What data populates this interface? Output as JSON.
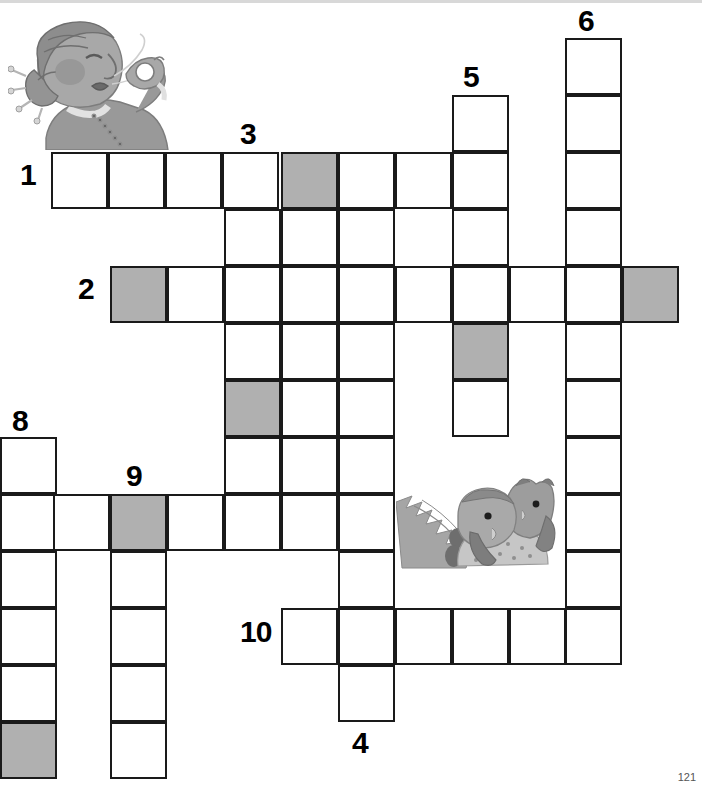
{
  "page": {
    "number": "121",
    "type": "crossword-puzzle-worksheet",
    "background_color": "#ffffff",
    "ink_color": "#1a1a1a",
    "shaded_cell_color": "#b0b0b0"
  },
  "grid": {
    "cell_size": 57,
    "origin_x": 0,
    "origin_y": 38,
    "columns_x": [
      0,
      53,
      110,
      167,
      224,
      281,
      338,
      395,
      452,
      509,
      565,
      622
    ],
    "rows_y": [
      38,
      95,
      152,
      209,
      266,
      323,
      380,
      437,
      494,
      551,
      608,
      665,
      722
    ],
    "cells": [
      {
        "x": 565,
        "y": 38,
        "shaded": false
      },
      {
        "x": 565,
        "y": 95,
        "shaded": false
      },
      {
        "x": 452,
        "y": 95,
        "shaded": false
      },
      {
        "x": 565,
        "y": 152,
        "shaded": false
      },
      {
        "x": 452,
        "y": 152,
        "shaded": false
      },
      {
        "x": 51,
        "y": 152,
        "shaded": false
      },
      {
        "x": 108,
        "y": 152,
        "shaded": false
      },
      {
        "x": 165,
        "y": 152,
        "shaded": false
      },
      {
        "x": 222,
        "y": 152,
        "shaded": false
      },
      {
        "x": 281,
        "y": 152,
        "shaded": true
      },
      {
        "x": 338,
        "y": 152,
        "shaded": false
      },
      {
        "x": 395,
        "y": 152,
        "shaded": false
      },
      {
        "x": 452,
        "y": 209,
        "shaded": false
      },
      {
        "x": 565,
        "y": 209,
        "shaded": false
      },
      {
        "x": 224,
        "y": 209,
        "shaded": false
      },
      {
        "x": 281,
        "y": 209,
        "shaded": false
      },
      {
        "x": 338,
        "y": 209,
        "shaded": false
      },
      {
        "x": 110,
        "y": 266,
        "shaded": true
      },
      {
        "x": 167,
        "y": 266,
        "shaded": false
      },
      {
        "x": 224,
        "y": 266,
        "shaded": false
      },
      {
        "x": 281,
        "y": 266,
        "shaded": false
      },
      {
        "x": 338,
        "y": 266,
        "shaded": false
      },
      {
        "x": 395,
        "y": 266,
        "shaded": false
      },
      {
        "x": 452,
        "y": 266,
        "shaded": false
      },
      {
        "x": 509,
        "y": 266,
        "shaded": false
      },
      {
        "x": 565,
        "y": 266,
        "shaded": false
      },
      {
        "x": 622,
        "y": 266,
        "shaded": true
      },
      {
        "x": 224,
        "y": 323,
        "shaded": false
      },
      {
        "x": 281,
        "y": 323,
        "shaded": false
      },
      {
        "x": 338,
        "y": 323,
        "shaded": false
      },
      {
        "x": 452,
        "y": 323,
        "shaded": true
      },
      {
        "x": 565,
        "y": 323,
        "shaded": false
      },
      {
        "x": 224,
        "y": 380,
        "shaded": true
      },
      {
        "x": 281,
        "y": 380,
        "shaded": false
      },
      {
        "x": 338,
        "y": 380,
        "shaded": false
      },
      {
        "x": 452,
        "y": 380,
        "shaded": false
      },
      {
        "x": 565,
        "y": 380,
        "shaded": false
      },
      {
        "x": 0,
        "y": 437,
        "shaded": false
      },
      {
        "x": 224,
        "y": 437,
        "shaded": false
      },
      {
        "x": 281,
        "y": 437,
        "shaded": false
      },
      {
        "x": 338,
        "y": 437,
        "shaded": false
      },
      {
        "x": 565,
        "y": 437,
        "shaded": false
      },
      {
        "x": 0,
        "y": 494,
        "shaded": false
      },
      {
        "x": 53,
        "y": 494,
        "shaded": false
      },
      {
        "x": 110,
        "y": 494,
        "shaded": true
      },
      {
        "x": 167,
        "y": 494,
        "shaded": false
      },
      {
        "x": 224,
        "y": 494,
        "shaded": false
      },
      {
        "x": 281,
        "y": 494,
        "shaded": false
      },
      {
        "x": 338,
        "y": 494,
        "shaded": false
      },
      {
        "x": 565,
        "y": 494,
        "shaded": false
      },
      {
        "x": 0,
        "y": 551,
        "shaded": false
      },
      {
        "x": 110,
        "y": 551,
        "shaded": false
      },
      {
        "x": 338,
        "y": 551,
        "shaded": false
      },
      {
        "x": 565,
        "y": 551,
        "shaded": false
      },
      {
        "x": 0,
        "y": 608,
        "shaded": false
      },
      {
        "x": 110,
        "y": 608,
        "shaded": false
      },
      {
        "x": 281,
        "y": 608,
        "shaded": false
      },
      {
        "x": 338,
        "y": 608,
        "shaded": false
      },
      {
        "x": 395,
        "y": 608,
        "shaded": false
      },
      {
        "x": 452,
        "y": 608,
        "shaded": false
      },
      {
        "x": 509,
        "y": 608,
        "shaded": false
      },
      {
        "x": 565,
        "y": 608,
        "shaded": false
      },
      {
        "x": 0,
        "y": 665,
        "shaded": false
      },
      {
        "x": 110,
        "y": 665,
        "shaded": false
      },
      {
        "x": 338,
        "y": 665,
        "shaded": false
      },
      {
        "x": 0,
        "y": 722,
        "shaded": true
      },
      {
        "x": 110,
        "y": 722,
        "shaded": false
      }
    ]
  },
  "clue_numbers": [
    {
      "label": "1",
      "x": 20,
      "y": 160,
      "name": "clue-number-1"
    },
    {
      "label": "2",
      "x": 78,
      "y": 274,
      "name": "clue-number-2"
    },
    {
      "label": "3",
      "x": 240,
      "y": 119,
      "name": "clue-number-3"
    },
    {
      "label": "4",
      "x": 352,
      "y": 728,
      "name": "clue-number-4"
    },
    {
      "label": "5",
      "x": 463,
      "y": 62,
      "name": "clue-number-5"
    },
    {
      "label": "6",
      "x": 578,
      "y": 6,
      "name": "clue-number-6"
    },
    {
      "label": "8",
      "x": 12,
      "y": 406,
      "name": "clue-number-8"
    },
    {
      "label": "9",
      "x": 126,
      "y": 461,
      "name": "clue-number-9"
    },
    {
      "label": "10",
      "x": 240,
      "y": 617,
      "name": "clue-number-10"
    }
  ],
  "illustrations": [
    {
      "name": "grandmother-whistling-illustration",
      "alt": "Elderly woman in profile with bun hairstyle whistling with fingers",
      "x": 8,
      "y": 10,
      "width": 172,
      "height": 140
    },
    {
      "name": "two-owls-illustration",
      "alt": "Two grey owls perched together on a branch",
      "x": 396,
      "y": 472,
      "width": 170,
      "height": 106
    }
  ]
}
